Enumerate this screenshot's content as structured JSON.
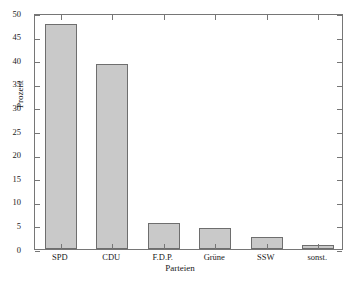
{
  "chart_data": {
    "type": "bar",
    "title": "",
    "xlabel": "Parteien",
    "ylabel": "Prozent",
    "categories": [
      "SPD",
      "CDU",
      "F.D.P.",
      "Grüne",
      "SSW",
      "sonst."
    ],
    "values": [
      47.7,
      39.2,
      5.5,
      4.5,
      2.6,
      0.9
    ],
    "ylim": [
      0,
      50
    ],
    "yticks": [
      0,
      5,
      10,
      15,
      20,
      25,
      30,
      35,
      40,
      45,
      50
    ],
    "ytick_labels": [
      "0",
      "5",
      "10",
      "15",
      "20",
      "25",
      "30",
      "35",
      "40",
      "45",
      "50"
    ],
    "grid": false,
    "legend": null,
    "bar_fill_color": "#c9c9c9",
    "bar_edge_color": "#6e6e6e",
    "axis_color": "#767676",
    "background_color": "#ffffff"
  }
}
